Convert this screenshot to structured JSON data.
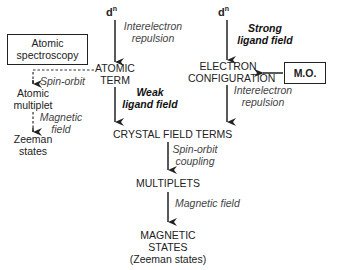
{
  "diagram": {
    "nodes": {
      "dn_left": "d",
      "dn_left_sup": "n",
      "dn_right": "d",
      "dn_right_sup": "n",
      "atomic_term": [
        "ATOMIC",
        "TERM"
      ],
      "electron_configuration": [
        "ELECTRON",
        "CONFIGURATION"
      ],
      "crystal_field_terms": "CRYSTAL FIELD TERMS",
      "multiplets": "MULTIPLETS",
      "magnetic_states": [
        "MAGNETIC",
        "STATES",
        "(Zeeman states)"
      ],
      "atomic_spectroscopy": [
        "Atomic",
        "spectroscopy"
      ],
      "mo": "M.O.",
      "atomic_multiplet": [
        "Atomic",
        "multiplet"
      ],
      "zeeman_states": [
        "Zeeman",
        "states"
      ]
    },
    "edge_labels": {
      "interelectron_repulsion_left": [
        "Interelectron",
        "repulsion"
      ],
      "strong_ligand_field": [
        "Strong",
        "ligand field"
      ],
      "weak_ligand_field": [
        "Weak",
        "ligand field"
      ],
      "interelectron_repulsion_right": [
        "Interelectron",
        "repulsion"
      ],
      "spin_orbit_left": "Spin-orbit",
      "magnetic_field_left": [
        "Magnetic",
        "field"
      ],
      "spin_orbit_coupling": [
        "Spin-orbit",
        "coupling"
      ],
      "magnetic_field": "Magnetic field"
    }
  }
}
